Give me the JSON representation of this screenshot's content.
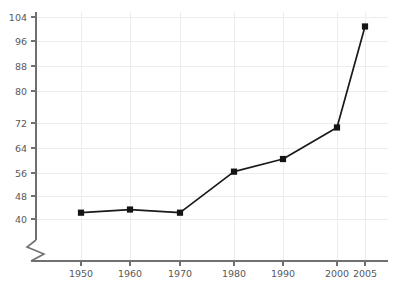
{
  "chart_data": {
    "type": "line",
    "title": "",
    "subtitle": "",
    "xlabel": "",
    "ylabel": "",
    "x": [
      1950,
      1960,
      1970,
      1980,
      1990,
      2000,
      2005
    ],
    "xtick_labels": [
      "1950",
      "1960",
      "1970",
      "1980",
      "1990",
      "2000",
      "2005"
    ],
    "values": [
      42,
      43,
      42,
      55,
      59,
      69,
      101
    ],
    "ytick_labels": [
      "40",
      "48",
      "56",
      "64",
      "72",
      "80",
      "88",
      "96",
      "104"
    ],
    "yticks": [
      40,
      48,
      56,
      64,
      72,
      80,
      88,
      96,
      104
    ],
    "ylim": [
      40,
      104
    ],
    "xlim": [
      1946,
      2009
    ],
    "y_axis_break": true,
    "grid": true,
    "legend": null,
    "legend_position": "none",
    "series": [
      {
        "name": "series-1",
        "values": [
          42,
          43,
          42,
          55,
          59,
          69,
          101
        ],
        "line_color": "#1a1a1a",
        "marker": "square"
      }
    ],
    "colors": {
      "line": "#1a1a1a",
      "marker": "#141414",
      "grid": "#ececee",
      "axis": "#6f7072",
      "tick_text": "#58585a",
      "background": "#ffffff"
    },
    "pixel_layout": {
      "x_positions": [
        81,
        130,
        180,
        234,
        283,
        337,
        365
      ],
      "y_positions": [
        213,
        210,
        214,
        173,
        158,
        130,
        26
      ],
      "y_axis_x": 36,
      "x_axis_y": 261,
      "y_top": 17,
      "y_bottom": 219,
      "plot_right": 388
    }
  }
}
